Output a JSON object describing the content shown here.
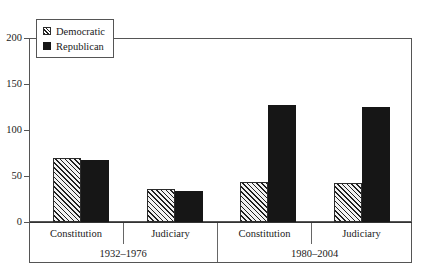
{
  "chart_data": {
    "type": "bar",
    "title": "",
    "subtitle": "",
    "xlabel": "",
    "ylabel": "",
    "ylim": [
      0,
      200
    ],
    "yticks": [
      0,
      50,
      100,
      150,
      200
    ],
    "ytick_labels": [
      "0",
      "50",
      "100",
      "150",
      "200"
    ],
    "grid": false,
    "legend_position": "top-left",
    "orientation": "vertical",
    "grouping": "grouped",
    "categories": [
      "Constitution",
      "Judiciary",
      "Constitution",
      "Judiciary"
    ],
    "group_labels": [
      "1932–1976",
      "1980–2004"
    ],
    "group_spans": [
      2,
      2
    ],
    "series": [
      {
        "name": "Democratic",
        "fill": "diagonal-hatch",
        "color": "#1f1f1f",
        "values": [
          70,
          36,
          43,
          42
        ]
      },
      {
        "name": "Republican",
        "fill": "solid",
        "color": "#161616",
        "values": [
          67,
          34,
          127,
          125
        ]
      }
    ]
  },
  "legend": {
    "items": [
      {
        "label": "Democratic",
        "swatch": "hatch-swatch-icon"
      },
      {
        "label": "Republican",
        "swatch": "solid-swatch-icon"
      }
    ]
  },
  "axis": {
    "y_labels": [
      "200",
      "150",
      "100",
      "50",
      "0"
    ]
  },
  "categories": {
    "labels": [
      "Constitution",
      "Judiciary",
      "Constitution",
      "Judiciary"
    ]
  },
  "periods": {
    "labels": [
      "1932–1976",
      "1980–2004"
    ]
  },
  "colors": {
    "frame": "#555555",
    "bar_dem": "#1f1f1f",
    "bar_rep": "#161616",
    "background": "#ffffff"
  }
}
